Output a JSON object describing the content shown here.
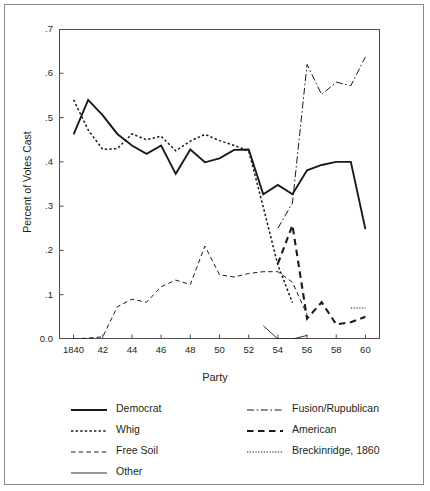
{
  "chart_data": {
    "type": "line",
    "title": "",
    "xlabel": "Party",
    "ylabel": "Percent of Votes Cast",
    "xlim": [
      1839,
      1861
    ],
    "ylim": [
      0.0,
      0.7
    ],
    "grid": false,
    "legend_position": "bottom",
    "x_tick_labels": [
      "1840",
      "42",
      "44",
      "46",
      "48",
      "50",
      "52",
      "54",
      "56",
      "58",
      "60"
    ],
    "x_tick_values": [
      1840,
      1842,
      1844,
      1846,
      1848,
      1850,
      1852,
      1854,
      1856,
      1858,
      1860
    ],
    "y_tick_labels": [
      "0.0",
      ".1",
      ".2",
      ".3",
      ".4",
      ".5",
      ".6",
      ".7"
    ],
    "y_tick_values": [
      0.0,
      0.1,
      0.2,
      0.3,
      0.4,
      0.5,
      0.6,
      0.7
    ],
    "series": [
      {
        "name": "Democrat",
        "style": "solid-thick",
        "x": [
          1840,
          1841,
          1842,
          1843,
          1844,
          1845,
          1846,
          1847,
          1848,
          1849,
          1850,
          1851,
          1852,
          1853,
          1854,
          1855,
          1856,
          1857,
          1858,
          1859,
          1860
        ],
        "values": [
          0.462,
          0.54,
          0.505,
          0.463,
          0.437,
          0.418,
          0.437,
          0.373,
          0.428,
          0.399,
          0.408,
          0.427,
          0.428,
          0.327,
          0.348,
          0.327,
          0.381,
          0.393,
          0.4,
          0.4,
          0.248
        ]
      },
      {
        "name": "Whig",
        "style": "dotted",
        "x": [
          1840,
          1841,
          1842,
          1843,
          1844,
          1845,
          1846,
          1847,
          1848,
          1849,
          1850,
          1851,
          1852,
          1853,
          1854,
          1855
        ],
        "values": [
          0.54,
          0.472,
          0.428,
          0.43,
          0.463,
          0.45,
          0.458,
          0.425,
          0.447,
          0.462,
          0.448,
          0.437,
          0.425,
          0.298,
          0.167,
          0.082
        ]
      },
      {
        "name": "Free Soil",
        "style": "dashed-fine",
        "x": [
          1840,
          1841,
          1842,
          1843,
          1844,
          1845,
          1846,
          1847,
          1848,
          1849,
          1850,
          1851,
          1852,
          1853,
          1854,
          1855,
          1856
        ],
        "values": [
          0.0,
          0.002,
          0.005,
          0.073,
          0.09,
          0.083,
          0.118,
          0.133,
          0.123,
          0.21,
          0.145,
          0.14,
          0.148,
          0.152,
          0.152,
          0.128,
          0.055
        ]
      },
      {
        "name": "Other",
        "style": "solid-thin",
        "x": [
          1853,
          1854,
          1855,
          1856
        ],
        "values": [
          0.03,
          0.0,
          0.0,
          0.008
        ]
      },
      {
        "name": "Fusion/Rupublican",
        "style": "dash-dot",
        "x": [
          1854,
          1855,
          1856,
          1857,
          1858,
          1859,
          1860
        ],
        "values": [
          0.25,
          0.307,
          0.62,
          0.552,
          0.58,
          0.572,
          0.637
        ]
      },
      {
        "name": "American",
        "style": "dashed-thick",
        "x": [
          1854,
          1855,
          1856,
          1857,
          1858,
          1859,
          1860
        ],
        "values": [
          0.17,
          0.257,
          0.046,
          0.083,
          0.033,
          0.038,
          0.05
        ]
      },
      {
        "name": "Breckinridge, 1860",
        "style": "dotted-fine",
        "x": [
          1859,
          1860
        ],
        "values": [
          0.07,
          0.07
        ]
      }
    ]
  },
  "axis": {
    "y_title": "Percent of Votes Cast",
    "x_title": "Party"
  },
  "legend": {
    "left_items": [
      {
        "label": "Democrat",
        "style": "solid-thick"
      },
      {
        "label": "Whig",
        "style": "dotted"
      },
      {
        "label": "Free Soil",
        "style": "dashed-fine"
      },
      {
        "label": "Other",
        "style": "solid-thin"
      }
    ],
    "right_items": [
      {
        "label": "Fusion/Rupublican",
        "style": "dash-dot"
      },
      {
        "label": "American",
        "style": "dashed-thick"
      },
      {
        "label": "Breckinridge, 1860",
        "style": "dotted-fine"
      }
    ]
  }
}
